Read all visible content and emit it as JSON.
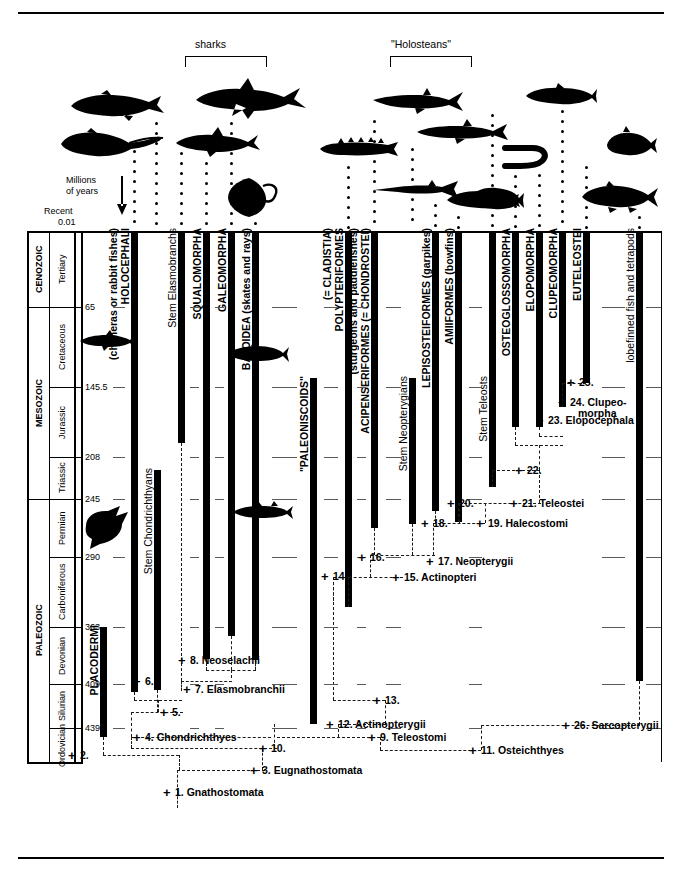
{
  "figure": {
    "axis_label_line1": "Millions",
    "axis_label_line2": "of years",
    "recent_label": "Recent",
    "recent_value": "0.01"
  },
  "top_brackets": [
    {
      "label": "sharks"
    },
    {
      "label": "\"Holosteans\""
    }
  ],
  "timescale": {
    "eras": [
      {
        "name": "CENOZOIC",
        "top": 231,
        "bottom": 307
      },
      {
        "name": "MESOZOIC",
        "top": 307,
        "bottom": 499
      },
      {
        "name": "PALEOZOIC",
        "top": 499,
        "bottom": 762
      }
    ],
    "periods": [
      {
        "name": "Tertiary",
        "top": 231,
        "bottom": 307
      },
      {
        "name": "Cretaceous",
        "top": 307,
        "bottom": 387
      },
      {
        "name": "Jurassic",
        "top": 387,
        "bottom": 457
      },
      {
        "name": "Triassic",
        "top": 457,
        "bottom": 499
      },
      {
        "name": "Permian",
        "top": 499,
        "bottom": 557
      },
      {
        "name": "Carboniferous",
        "top": 557,
        "bottom": 627
      },
      {
        "name": "Devonian",
        "top": 627,
        "bottom": 684
      },
      {
        "name": "Silurian",
        "top": 684,
        "bottom": 728
      },
      {
        "name": "Ordovician",
        "top": 728,
        "bottom": 762
      }
    ],
    "ticks": [
      {
        "value": "65",
        "y": 307
      },
      {
        "value": "145.5",
        "y": 387
      },
      {
        "value": "208",
        "y": 457
      },
      {
        "value": "245",
        "y": 499
      },
      {
        "value": "290",
        "y": 557
      },
      {
        "value": "363",
        "y": 627
      },
      {
        "value": "409",
        "y": 684
      },
      {
        "value": "439",
        "y": 728
      }
    ]
  },
  "taxa": [
    {
      "name": "PLACODERMI",
      "style": "bold",
      "x": 100,
      "bar_top": 627,
      "bar_bottom": 737,
      "label_y": 625
    },
    {
      "name": "HOLOCEPHALI",
      "name2": "(chimeras or rabbit fishes)",
      "style": "bold",
      "x": 131,
      "bar_top": 231,
      "bar_bottom": 692,
      "label_y": 228
    },
    {
      "name": "Stem Chondrichthyans",
      "style": "plain",
      "x": 154,
      "bar_top": 470,
      "bar_bottom": 690,
      "label_y": 468
    },
    {
      "name": "Stem Elasmobranchs",
      "style": "plain",
      "x": 178,
      "bar_top": 231,
      "bar_bottom": 443,
      "label_y": 228
    },
    {
      "name": "SQUALOMORPHA",
      "style": "bold",
      "x": 203,
      "bar_top": 231,
      "bar_bottom": 659,
      "label_y": 228
    },
    {
      "name": "GALEOMORPHA",
      "style": "bold",
      "x": 228,
      "bar_top": 231,
      "bar_bottom": 636,
      "label_y": 228
    },
    {
      "name": "BATOIDEA (skates and rays)",
      "style": "bold",
      "x": 252,
      "bar_top": 231,
      "bar_bottom": 660,
      "label_y": 228
    },
    {
      "name": "\"PALEONISCOIDS\"",
      "style": "bold",
      "x": 310,
      "bar_top": 378,
      "bar_bottom": 724,
      "label_y": 376
    },
    {
      "name": "POLYPTERIFORMES",
      "name2": "(= CLADISTIA)",
      "style": "bold",
      "x": 345,
      "bar_top": 231,
      "bar_bottom": 607,
      "label_y": 228
    },
    {
      "name": "ACIPENSERIFORMES (= CHONDROSTEI)",
      "name2": "(sturgeons and paddlefishes)",
      "style": "bold",
      "x": 371,
      "bar_top": 231,
      "bar_bottom": 528,
      "label_y": 228
    },
    {
      "name": "Stem Neopterygians",
      "style": "plain",
      "x": 409,
      "bar_top": 378,
      "bar_bottom": 524,
      "label_y": 376
    },
    {
      "name": "LEPISOSTEIFORMES (garpikes)",
      "style": "bold",
      "x": 432,
      "bar_top": 231,
      "bar_bottom": 511,
      "label_y": 228
    },
    {
      "name": "AMIIFORMES (bowfins)",
      "style": "bold",
      "x": 455,
      "bar_top": 231,
      "bar_bottom": 522,
      "label_y": 228
    },
    {
      "name": "Stem Teleosts",
      "style": "plain",
      "x": 489,
      "bar_top": 231,
      "bar_bottom": 487,
      "label_y": 376
    },
    {
      "name": "OSTEOGLOSSOMORPHA",
      "style": "bold",
      "x": 512,
      "bar_top": 231,
      "bar_bottom": 427,
      "label_y": 228
    },
    {
      "name": "ELOPOMORPHA",
      "style": "bold",
      "x": 536,
      "bar_top": 231,
      "bar_bottom": 427,
      "label_y": 228
    },
    {
      "name": "CLUPEOMORPHA",
      "style": "bold",
      "x": 559,
      "bar_top": 231,
      "bar_bottom": 407,
      "label_y": 228
    },
    {
      "name": "EUTELEOSTEI",
      "style": "bold",
      "x": 583,
      "bar_top": 231,
      "bar_bottom": 383,
      "label_y": 228
    },
    {
      "name": "lobefinned fish and tetrapods",
      "style": "plain",
      "x": 636,
      "bar_top": 231,
      "bar_bottom": 681,
      "label_y": 228
    }
  ],
  "clades": [
    {
      "n": "1.",
      "label": "Gnathostomata",
      "x": 175,
      "y": 792
    },
    {
      "n": "2.",
      "label": "",
      "x": 80,
      "y": 755
    },
    {
      "n": "3.",
      "label": "Eugnathostomata",
      "x": 262,
      "y": 770
    },
    {
      "n": "4.",
      "label": "Chondrichthyes",
      "x": 145,
      "y": 737
    },
    {
      "n": "5.",
      "label": "",
      "x": 172,
      "y": 712
    },
    {
      "n": "6.",
      "label": "",
      "x": 145,
      "y": 681
    },
    {
      "n": "7.",
      "label": "Elasmobranchii",
      "x": 195,
      "y": 689
    },
    {
      "n": "8.",
      "label": "Neoselachii",
      "x": 190,
      "y": 660
    },
    {
      "n": "9.",
      "label": "Teleostomi",
      "x": 380,
      "y": 737
    },
    {
      "n": "10.",
      "label": "",
      "x": 271,
      "y": 748
    },
    {
      "n": "11.",
      "label": "Osteichthyes",
      "x": 481,
      "y": 750
    },
    {
      "n": "12.",
      "label": "Actinopterygii",
      "x": 338,
      "y": 724
    },
    {
      "n": "13.",
      "label": "",
      "x": 385,
      "y": 700
    },
    {
      "n": "14.",
      "label": "",
      "x": 333,
      "y": 576
    },
    {
      "n": "15.",
      "label": "Actinopteri",
      "x": 404,
      "y": 577
    },
    {
      "n": "16.",
      "label": "",
      "x": 370,
      "y": 557
    },
    {
      "n": "17.",
      "label": "Neopterygii",
      "x": 438,
      "y": 561
    },
    {
      "n": "18.",
      "label": "",
      "x": 433,
      "y": 523
    },
    {
      "n": "19.",
      "label": "Halecostomi",
      "x": 488,
      "y": 523
    },
    {
      "n": "20.",
      "label": "",
      "x": 459,
      "y": 503
    },
    {
      "n": "21.",
      "label": "Teleostei",
      "x": 522,
      "y": 503
    },
    {
      "n": "22.",
      "label": "",
      "x": 527,
      "y": 470
    },
    {
      "n": "23.",
      "label": "Elopocephala",
      "x": 548,
      "y": 420
    },
    {
      "n": "24.",
      "label": "Clupeo-",
      "label2": "morpha",
      "x": 570,
      "y": 402
    },
    {
      "n": "25.",
      "label": "",
      "x": 579,
      "y": 382
    },
    {
      "n": "26.",
      "label": "Sarcopterygii",
      "x": 574,
      "y": 725
    }
  ]
}
